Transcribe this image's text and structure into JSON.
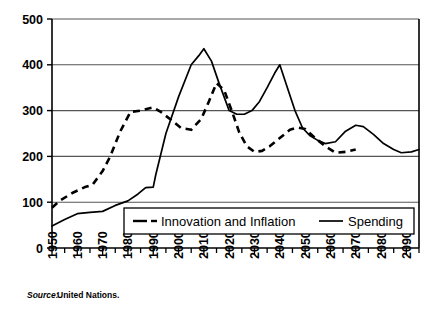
{
  "chart_data": {
    "type": "line",
    "title": "",
    "xlabel": "",
    "ylabel": "",
    "xlim": [
      1950,
      2095
    ],
    "ylim": [
      0,
      500
    ],
    "yticks": [
      0,
      100,
      200,
      300,
      400,
      500
    ],
    "ytick_labels": [
      "0",
      "100",
      "200",
      "300",
      "400",
      "500"
    ],
    "xticks": [
      1950,
      1960,
      1970,
      1980,
      1990,
      2000,
      2010,
      2020,
      2030,
      2040,
      2050,
      2060,
      2070,
      2080,
      2090
    ],
    "xtick_labels": [
      "1950",
      "1960",
      "1970",
      "1980",
      "1990",
      "2000",
      "2010",
      "2020",
      "2030",
      "2040",
      "2050",
      "2060",
      "2070",
      "2080",
      "2090"
    ],
    "xminor_interval": 5,
    "grid": "horizontal",
    "legend_position": "inside-bottom-center",
    "series": [
      {
        "name": "Innovation and Inflation",
        "style": "dashed",
        "x": [
          1950,
          1953,
          1958,
          1963,
          1966,
          1970,
          1973,
          1977,
          1981,
          1985,
          1990,
          1993,
          1997,
          2001,
          2005,
          2009,
          2012,
          2015,
          2018,
          2021,
          2024,
          2027,
          2030,
          2033,
          2036,
          2040,
          2044,
          2047,
          2050,
          2054,
          2058,
          2062,
          2066,
          2070
        ],
        "y": [
          88,
          103,
          120,
          133,
          138,
          168,
          200,
          255,
          297,
          300,
          307,
          297,
          280,
          262,
          258,
          282,
          320,
          360,
          345,
          300,
          252,
          222,
          210,
          212,
          222,
          240,
          258,
          263,
          260,
          240,
          222,
          208,
          210,
          215
        ]
      },
      {
        "name": "Spending",
        "style": "solid",
        "x": [
          1950,
          1955,
          1960,
          1965,
          1970,
          1975,
          1980,
          1984,
          1987,
          1990,
          1991,
          1995,
          2000,
          2005,
          2008,
          2010,
          2013,
          2016,
          2020,
          2023,
          2026,
          2029,
          2032,
          2035,
          2038,
          2040,
          2043,
          2046,
          2049,
          2052,
          2055,
          2058,
          2062,
          2066,
          2070,
          2073,
          2077,
          2081,
          2085,
          2088,
          2092,
          2095
        ],
        "y": [
          48,
          62,
          75,
          78,
          80,
          93,
          103,
          118,
          132,
          133,
          160,
          250,
          330,
          400,
          420,
          435,
          408,
          360,
          300,
          292,
          292,
          300,
          320,
          350,
          382,
          400,
          350,
          300,
          262,
          245,
          235,
          228,
          232,
          255,
          268,
          265,
          248,
          228,
          215,
          208,
          210,
          215
        ]
      }
    ]
  },
  "legend": {
    "items": [
      {
        "label": "Innovation and Inflation",
        "style": "dashed"
      },
      {
        "label": "Spending",
        "style": "solid"
      }
    ]
  },
  "source": {
    "prefix": "Source:",
    "text": "United Nations."
  }
}
